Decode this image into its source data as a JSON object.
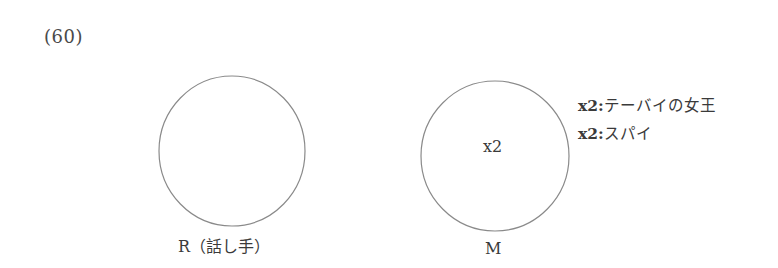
{
  "example_number": "(60)",
  "circles": [
    {
      "id": "R",
      "label": "R（話し手）",
      "inner_text": "",
      "cx": 232,
      "cy": 151,
      "rx": 73,
      "ry": 75
    },
    {
      "id": "M",
      "label": "M",
      "inner_text": "x2",
      "cx": 495,
      "cy": 156,
      "rx": 74,
      "ry": 75
    }
  ],
  "descriptions": [
    {
      "var": "x2:",
      "text": "テーバイの女王"
    },
    {
      "var": "x2:",
      "text": "スパイ"
    }
  ],
  "colors": {
    "stroke": "#8a8a8a",
    "text": "#3a3a3a"
  }
}
